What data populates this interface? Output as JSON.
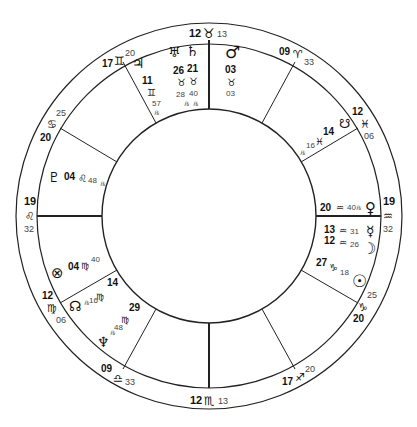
{
  "chart_title": "",
  "geometry": {
    "cx": 209,
    "cy": 216,
    "r_outer": 193,
    "r_mid": 172,
    "r_inner": 107
  },
  "house_cusps": [
    {
      "name": "MC",
      "deg": "12",
      "sign": "♉",
      "min": "13",
      "x": 209,
      "y": 33,
      "line": [
        209,
        44,
        209,
        109
      ],
      "heavy": true
    },
    {
      "name": "11",
      "deg": "09",
      "sign": "♈",
      "min": "33",
      "x": 294,
      "y": 46,
      "line": [
        295,
        63,
        262,
        123
      ]
    },
    {
      "name": "12",
      "deg": "12",
      "sign": "♓",
      "min": "06",
      "x": 364,
      "y": 114,
      "line": [
        356,
        128,
        300,
        162
      ]
    },
    {
      "name": "ASC",
      "deg": "19",
      "sign": "♒",
      "min": "32",
      "x": 392,
      "y": 210,
      "line": [
        381,
        216,
        314,
        216
      ],
      "heavy": true
    },
    {
      "name": "2",
      "deg": "20",
      "sign": "♑",
      "min": "25",
      "x": 364,
      "y": 300,
      "line": [
        356,
        303,
        300,
        270
      ]
    },
    {
      "name": "3",
      "deg": "17",
      "sign": "♐",
      "min": "20",
      "x": 296,
      "y": 378,
      "line": [
        295,
        368,
        262,
        309
      ]
    },
    {
      "name": "IC",
      "deg": "12",
      "sign": "♏",
      "min": "13",
      "x": 209,
      "y": 402,
      "line": [
        209,
        388,
        209,
        323
      ],
      "heavy": true
    },
    {
      "name": "5",
      "deg": "09",
      "sign": "♎",
      "min": "33",
      "x": 118,
      "y": 373,
      "line": [
        123,
        368,
        156,
        309
      ]
    },
    {
      "name": "6",
      "deg": "12",
      "sign": "♍",
      "min": "06",
      "x": 50,
      "y": 307,
      "line": [
        62,
        303,
        118,
        270
      ]
    },
    {
      "name": "DSC",
      "deg": "19",
      "sign": "♌",
      "min": "32",
      "x": 28,
      "y": 210,
      "line": [
        38,
        216,
        104,
        216
      ],
      "heavy": true
    },
    {
      "name": "8",
      "deg": "20",
      "sign": "♋",
      "min": "25",
      "x": 50,
      "y": 120,
      "line": [
        62,
        128,
        118,
        162
      ]
    },
    {
      "name": "9",
      "deg": "17",
      "sign": "♊",
      "min": "20",
      "x": 116,
      "y": 58,
      "line": [
        123,
        63,
        156,
        123
      ]
    }
  ],
  "planets": [
    {
      "name": "Mars",
      "glyph": "♂",
      "deg": "03",
      "sign": "♉",
      "min": "03",
      "retrograde": false
    },
    {
      "name": "Uranus",
      "glyph": "♅",
      "deg": "26",
      "sign": "♉",
      "min": "28",
      "retrograde": true
    },
    {
      "name": "Saturn",
      "glyph": "♄",
      "deg": "21",
      "sign": "♉",
      "min": "40",
      "retrograde": true
    },
    {
      "name": "Jupiter",
      "glyph": "♃",
      "deg": "11",
      "sign": "♊",
      "min": "57",
      "retrograde": true
    },
    {
      "name": "Pluto",
      "glyph": "♇",
      "deg": "04",
      "sign": "♌",
      "min": "48",
      "retrograde": true
    },
    {
      "name": "Part of Fortune",
      "glyph": "⊗",
      "deg": "04",
      "sign": "♍",
      "min": "40",
      "retrograde": false
    },
    {
      "name": "North Node",
      "glyph": "☊",
      "deg": "14",
      "sign": "♍",
      "min": "16",
      "retrograde": true
    },
    {
      "name": "Neptune",
      "glyph": "♆",
      "deg": "29",
      "sign": "♍",
      "min": "48",
      "retrograde": true
    },
    {
      "name": "South Node",
      "glyph": "☋",
      "deg": "14",
      "sign": "♓",
      "min": "16",
      "retrograde": true
    },
    {
      "name": "Venus",
      "glyph": "♀",
      "deg": "20",
      "sign": "♒",
      "min": "40",
      "retrograde": true
    },
    {
      "name": "Mercury",
      "glyph": "☿",
      "deg": "13",
      "sign": "♒",
      "min": "31",
      "retrograde": false
    },
    {
      "name": "Moon",
      "glyph": "☽",
      "deg": "12",
      "sign": "♒",
      "min": "26",
      "retrograde": false
    },
    {
      "name": "Sun",
      "glyph": "☉",
      "deg": "27",
      "sign": "♑",
      "min": "18",
      "retrograde": false
    }
  ],
  "rx_symbol": "℞"
}
